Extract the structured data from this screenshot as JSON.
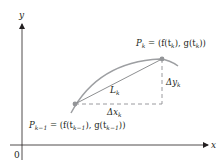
{
  "diagram": {
    "axes": {
      "x_label": "x",
      "y_label": "y",
      "origin_label": "0"
    },
    "points": {
      "p_k": {
        "name": "P",
        "sub": "k",
        "eq": " = (f(t",
        "sub2": "k",
        "mid": "), g(t",
        "sub3": "k",
        "end": "))"
      },
      "p_km1": {
        "name": "P",
        "sub": "k−1",
        "eq": " = (f(t",
        "sub2": "k−1",
        "mid": "), g(t",
        "sub3": "k−1",
        "end": "))"
      }
    },
    "segment_label": {
      "name": "L",
      "sub": "k"
    },
    "dx_label": {
      "name": "Δx",
      "sub": "k"
    },
    "dy_label": {
      "name": "Δy",
      "sub": "k"
    },
    "colors": {
      "curve": "#9d9fa2",
      "chord": "#808285",
      "axes": "#231f20",
      "dashed": "#808285",
      "point": "#939598"
    }
  }
}
